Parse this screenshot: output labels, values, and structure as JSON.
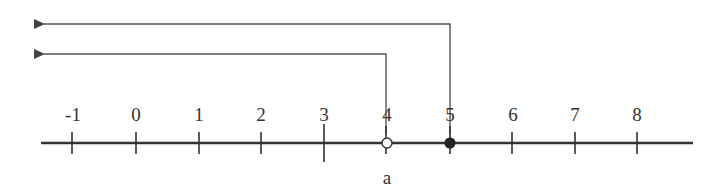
{
  "diagram": {
    "type": "number-line",
    "colors": {
      "axis": "#333333",
      "bracket": "#555555",
      "text": "#333333",
      "open_point_fill": "#ffffff",
      "closed_point_fill": "#222222"
    },
    "axis": {
      "min": -1,
      "max": 8,
      "tick_labels": [
        "-1",
        "0",
        "1",
        "2",
        "3",
        "4",
        "5",
        "6",
        "7",
        "8"
      ]
    },
    "points": [
      {
        "value": 4,
        "style": "open",
        "label": "a"
      },
      {
        "value": 5,
        "style": "closed"
      }
    ],
    "arrows": [
      {
        "from_value": 5,
        "direction": "left",
        "level": "upper"
      },
      {
        "from_value": 4,
        "direction": "left",
        "level": "lower"
      }
    ],
    "variable_label": "a"
  }
}
